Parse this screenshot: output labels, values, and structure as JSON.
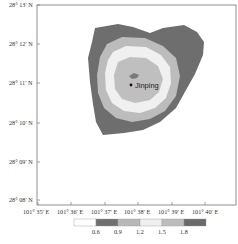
{
  "map": {
    "frame": {
      "x0": 37,
      "y0": 5,
      "x1": 236,
      "y1": 205
    },
    "y_axis_labels": [
      "28° 13′ N",
      "28° 12′ N",
      "28° 11′ N",
      "28° 10′ N",
      "28° 09′ N",
      "28° 08′ N"
    ],
    "x_axis_labels": [
      "101° 35′ E",
      "101° 36′ E",
      "101° 37′ E",
      "101° 38′ E",
      "101° 39′ E",
      "101° 40′ E"
    ],
    "place_label": "Jinping",
    "colorbar": {
      "ticks": [
        "0.6",
        "0.9",
        "1.2",
        "1.5",
        "1.8"
      ],
      "colors": [
        "#ffffff",
        "#6f6f6f",
        "#b8b8b8",
        "#efefef",
        "#bdbdbd",
        "#6a6a6a"
      ]
    },
    "contour_colors": {
      "outer": "#6e6e6e",
      "ring2": "#bcbcbc",
      "ring3": "#f0f0f0",
      "core": "#bfbfbf",
      "peak": "#7a7a7a"
    }
  }
}
